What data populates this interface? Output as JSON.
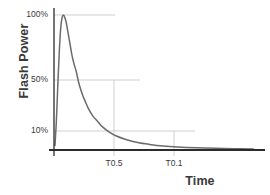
{
  "chart_data": {
    "type": "line",
    "title": "",
    "subtitle": "",
    "xlabel": "Time",
    "ylabel": "Flash Power",
    "grid": true,
    "legend": false,
    "legend_position": "none",
    "series_color": "#6b6b6b",
    "axis_color": "#2b2b2b",
    "grid_color": "#c9c9c9",
    "background": "#ffffff",
    "y_tick_labels": [
      "100%",
      "50%",
      "10%"
    ],
    "y_tick_values": [
      100,
      50,
      10
    ],
    "ylim": [
      0,
      108
    ],
    "x_tick_labels": [
      "T0.5",
      "T0.1"
    ],
    "x_tick_values": [
      0.5,
      1.15
    ],
    "xlim": [
      0,
      4.3
    ],
    "annotations": [
      "100% gridline marks peak flash power",
      "50% gridline intersects curve at T0.5",
      "10% gridline intersects curve at T0.1"
    ],
    "series": [
      {
        "name": "Flash Power",
        "x": [
          0.0,
          0.03,
          0.06,
          0.09,
          0.12,
          0.15,
          0.18,
          0.21,
          0.24,
          0.27,
          0.3,
          0.33,
          0.36,
          0.4,
          0.45,
          0.5,
          0.55,
          0.6,
          0.65,
          0.7,
          0.8,
          0.9,
          1.0,
          1.15,
          1.3,
          1.5,
          1.75,
          2.0,
          2.3,
          2.6,
          3.0,
          3.4,
          3.8,
          4.2
        ],
        "y": [
          3,
          22,
          48,
          72,
          90,
          98,
          100,
          98,
          94,
          88,
          82,
          76,
          70,
          64,
          58,
          50,
          44,
          39,
          35,
          31,
          25,
          21,
          17,
          13,
          10,
          7.5,
          5.2,
          3.8,
          2.6,
          1.9,
          1.3,
          0.9,
          0.6,
          0.4
        ]
      }
    ]
  },
  "axes": {
    "y_title": "Flash Power",
    "x_title": "Time"
  },
  "ticks": {
    "y": {
      "t100": "100%",
      "t50": "50%",
      "t10": "10%"
    },
    "x": {
      "t05": "T0.5",
      "t01": "T0.1"
    }
  }
}
